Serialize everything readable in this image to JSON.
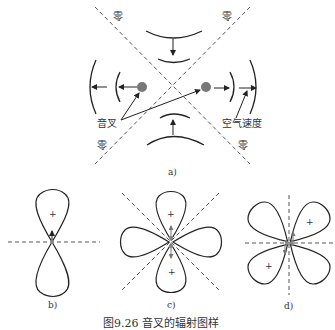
{
  "figure": {
    "caption": "图9.26  音叉的辐射图样",
    "panels": {
      "a": {
        "label": "a)",
        "zero_labels": [
          "零",
          "零",
          "零",
          "零"
        ],
        "tuning_fork_label": "音叉",
        "air_velocity_label": "空气速度"
      },
      "b": {
        "label": "b)",
        "plus_signs": [
          "+"
        ]
      },
      "c": {
        "label": "c)",
        "plus_signs": [
          "+",
          "+"
        ]
      },
      "d": {
        "label": "d)",
        "plus_signs": [
          "+",
          "+"
        ]
      }
    },
    "colors": {
      "line": "#222222",
      "dashed": "#555555",
      "dot": "#777777"
    }
  }
}
